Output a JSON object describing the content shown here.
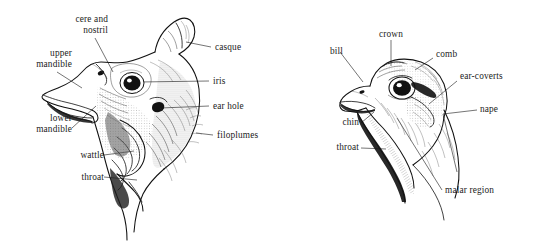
{
  "figure": {
    "type": "anatomical-diagram",
    "background_color": "#ffffff",
    "ink_color": "#1c1c1c",
    "text_color": "#1b1b1b",
    "panel_count": 2
  },
  "left_panel": {
    "name": "guineafowl-head",
    "labels": [
      {
        "id": "cere-and-nostril",
        "text": "cere and\nnostril"
      },
      {
        "id": "upper-mandible",
        "text": "upper\nmandible"
      },
      {
        "id": "lower-mandible",
        "text": "lower\nmandible"
      },
      {
        "id": "wattle",
        "text": "wattle"
      },
      {
        "id": "throat",
        "text": "throat"
      },
      {
        "id": "casque",
        "text": "casque"
      },
      {
        "id": "iris",
        "text": "iris"
      },
      {
        "id": "ear-hole",
        "text": "ear hole"
      },
      {
        "id": "filoplumes",
        "text": "filoplumes"
      }
    ]
  },
  "right_panel": {
    "name": "partridge-head",
    "labels": [
      {
        "id": "bill",
        "text": "bill"
      },
      {
        "id": "crown",
        "text": "crown"
      },
      {
        "id": "comb",
        "text": "comb"
      },
      {
        "id": "ear-coverts",
        "text": "ear-coverts"
      },
      {
        "id": "nape",
        "text": "nape"
      },
      {
        "id": "chin",
        "text": "chin"
      },
      {
        "id": "throat",
        "text": "throat"
      },
      {
        "id": "malar-region",
        "text": "malar region"
      }
    ]
  }
}
